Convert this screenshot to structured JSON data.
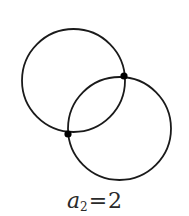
{
  "diagram": {
    "type": "intersecting-circles",
    "stroke_color": "#1a1a1a",
    "point_color": "#000000",
    "circles": [
      {
        "id": "circle-1",
        "cx": 73.5,
        "cy": 80.5,
        "r": 51.5
      },
      {
        "id": "circle-2",
        "cx": 119.5,
        "cy": 128.5,
        "r": 51.5
      }
    ],
    "intersection_points": [
      {
        "id": "point-upper-right",
        "x": 124,
        "y": 76
      },
      {
        "id": "point-lower-left",
        "x": 68,
        "y": 134
      }
    ],
    "intersection_count": 2
  },
  "label": {
    "variable": "a",
    "subscript": "2",
    "equals": "=",
    "value": "2"
  }
}
